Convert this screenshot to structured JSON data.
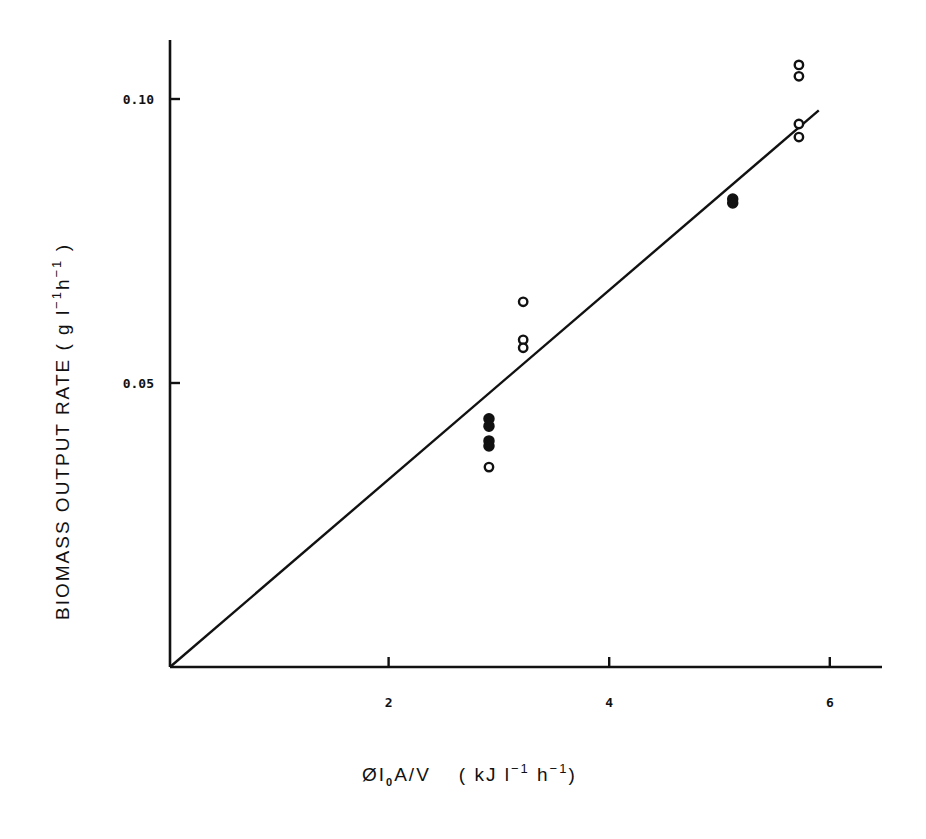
{
  "chart_data": {
    "type": "scatter",
    "title": "",
    "xlabel": "ØI₀A/V  (kJ l⁻¹ h⁻¹)",
    "ylabel": "BIOMASS OUTPUT RATE (g l⁻¹ h⁻¹)",
    "xlim": [
      0,
      6.5
    ],
    "ylim": [
      0,
      0.117
    ],
    "grid": false,
    "legend": null,
    "x_ticks": [
      {
        "value": 2,
        "label": "2"
      },
      {
        "value": 4,
        "label": "4"
      },
      {
        "value": 6,
        "label": "6"
      }
    ],
    "y_ticks": [
      {
        "value": 0.05,
        "label": "0.05"
      },
      {
        "value": 0.1,
        "label": "0.10"
      }
    ],
    "series": [
      {
        "name": "filled",
        "marker": "filled-circle",
        "points": [
          {
            "x": 2.91,
            "y": 0.0437
          },
          {
            "x": 2.91,
            "y": 0.0424
          },
          {
            "x": 2.91,
            "y": 0.0398
          },
          {
            "x": 2.91,
            "y": 0.0389
          },
          {
            "x": 5.12,
            "y": 0.0824
          },
          {
            "x": 5.12,
            "y": 0.0817
          }
        ]
      },
      {
        "name": "open",
        "marker": "open-circle",
        "points": [
          {
            "x": 2.91,
            "y": 0.0352
          },
          {
            "x": 3.22,
            "y": 0.0643
          },
          {
            "x": 3.22,
            "y": 0.0576
          },
          {
            "x": 3.22,
            "y": 0.0562
          },
          {
            "x": 5.72,
            "y": 0.106
          },
          {
            "x": 5.72,
            "y": 0.104
          },
          {
            "x": 5.72,
            "y": 0.0956
          },
          {
            "x": 5.72,
            "y": 0.0933
          }
        ]
      }
    ],
    "fit_line": {
      "type": "linear",
      "from": {
        "x": 0,
        "y": 0
      },
      "to": {
        "x": 5.9,
        "y": 0.098
      }
    }
  },
  "axes": {
    "x_title_main": "ØI",
    "x_title_sub": "0",
    "x_title_rest": "A/V",
    "x_units": "( kJ l",
    "x_units_exp1": "−1",
    "x_units_h": " h",
    "x_units_exp2": "−1",
    "x_units_close": ")",
    "y_title_main": "BIOMASS  OUTPUT  RATE  ( g l",
    "y_title_exp1": "−1",
    "y_title_h": "h",
    "y_title_exp2": "−1",
    "y_title_close": " )"
  },
  "style": {
    "ink": "#111111",
    "background": "#ffffff"
  }
}
